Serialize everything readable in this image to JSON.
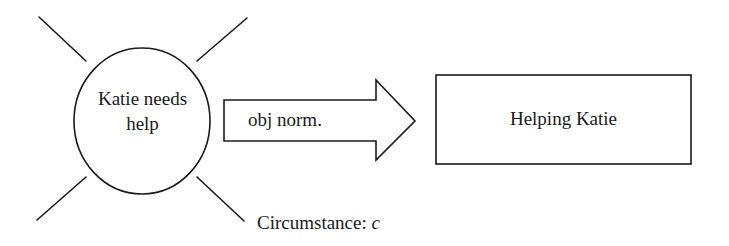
{
  "diagram": {
    "circle": {
      "line1": "Katie needs",
      "line2": "help"
    },
    "arrow": {
      "label": "obj norm."
    },
    "box": {
      "label": "Helping Katie"
    },
    "circumstance": {
      "label": "Circumstance:",
      "variable": "c"
    },
    "colors": {
      "stroke": "#1a1a1a",
      "fill": "#ffffff"
    }
  }
}
